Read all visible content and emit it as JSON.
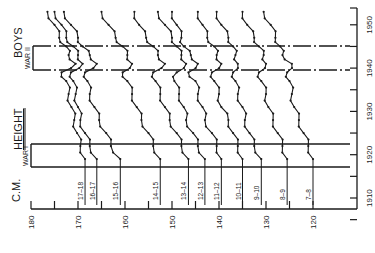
{
  "chart_data": {
    "type": "line",
    "title": "HEIGHT",
    "subtitle": "BOYS",
    "orientation": "rotated-90-ccw",
    "xlabel": "Year",
    "ylabel": "C.M.",
    "xlim": [
      1905,
      1955
    ],
    "ylim": [
      115,
      180
    ],
    "x_ticks": [
      1910,
      1920,
      1930,
      1940,
      1950
    ],
    "x_minor_ticks": [
      1905,
      1915,
      1925,
      1935,
      1945
    ],
    "y_ticks": [
      120,
      130,
      140,
      150,
      160,
      170,
      180
    ],
    "y_minor_ticks": [
      125,
      135,
      145,
      155,
      165,
      175
    ],
    "grid": false,
    "annotations": [
      {
        "label": "WAR I",
        "x_range": [
          1914,
          1919
        ]
      },
      {
        "label": "WAR II",
        "x_range": [
          1939,
          1945
        ]
      }
    ],
    "x": [
      1919,
      1922,
      1925,
      1928,
      1931,
      1934,
      1937,
      1939,
      1941,
      1943,
      1945,
      1947,
      1950,
      1953
    ],
    "series": [
      {
        "name": "17-18",
        "values": [
          168.5,
          169.5,
          170.2,
          170.8,
          171.4,
          172.0,
          172.5,
          173.5,
          170.5,
          172.0,
          172.5,
          174.0,
          175.0,
          176.5
        ]
      },
      {
        "name": "16-17",
        "values": [
          166.0,
          167.5,
          168.5,
          169.5,
          170.0,
          170.5,
          171.0,
          171.5,
          169.0,
          170.0,
          171.0,
          172.5,
          173.5,
          175.0
        ]
      },
      {
        "name": "15-16",
        "values": [
          161.0,
          163.0,
          164.0,
          165.5,
          166.5,
          167.5,
          168.0,
          168.5,
          166.0,
          167.5,
          169.0,
          170.0,
          171.5,
          173.0
        ]
      },
      {
        "name": "14-15",
        "values": [
          152.5,
          154.0,
          155.0,
          156.5,
          157.5,
          158.5,
          159.5,
          160.5,
          158.5,
          159.5,
          160.5,
          162.0,
          163.5,
          165.0
        ]
      },
      {
        "name": "13-14",
        "values": [
          146.5,
          148.0,
          149.0,
          150.5,
          151.5,
          152.5,
          153.5,
          154.0,
          151.5,
          153.0,
          154.0,
          155.5,
          157.0,
          158.0
        ]
      },
      {
        "name": "12-13",
        "values": [
          143.0,
          144.5,
          145.5,
          147.0,
          147.5,
          148.5,
          149.5,
          149.0,
          147.0,
          148.0,
          149.0,
          150.0,
          151.5,
          153.0
        ]
      },
      {
        "name": "11-12",
        "values": [
          139.5,
          140.5,
          141.5,
          143.0,
          143.5,
          144.5,
          145.0,
          146.5,
          144.5,
          146.0,
          147.5,
          148.0,
          149.0,
          150.0
        ]
      },
      {
        "name": "10-11",
        "values": [
          135.0,
          136.0,
          137.0,
          138.0,
          139.5,
          140.0,
          141.0,
          141.5,
          139.5,
          140.5,
          141.0,
          142.5,
          143.5,
          144.5
        ]
      },
      {
        "name": "9-10",
        "values": [
          131.0,
          132.5,
          133.5,
          134.5,
          135.0,
          136.0,
          136.5,
          137.0,
          136.0,
          136.5,
          137.0,
          138.0,
          139.5,
          140.5
        ]
      },
      {
        "name": "8-9",
        "values": [
          125.5,
          126.5,
          127.5,
          128.5,
          129.5,
          130.0,
          131.0,
          131.5,
          130.0,
          130.5,
          131.5,
          132.5,
          134.0,
          135.0
        ]
      },
      {
        "name": "7-8",
        "values": [
          120.0,
          121.0,
          122.0,
          123.0,
          124.0,
          124.5,
          125.0,
          125.5,
          124.5,
          126.5,
          127.0,
          128.0,
          129.0,
          130.5
        ]
      }
    ],
    "series_start": [
      {
        "name": "17-18",
        "start_year": 1919
      },
      {
        "name": "16-17",
        "start_year": 1919
      },
      {
        "name": "15-16",
        "start_year": 1919
      },
      {
        "name": "14-15",
        "start_year": 1914
      },
      {
        "name": "13-14",
        "start_year": 1915
      },
      {
        "name": "12-13",
        "start_year": 1915
      },
      {
        "name": "11-12",
        "start_year": 1913
      },
      {
        "name": "10-11",
        "start_year": 1913
      },
      {
        "name": "9-10",
        "start_year": 1911
      },
      {
        "name": "8-9",
        "start_year": 1910
      },
      {
        "name": "7-8",
        "start_year": 1907
      }
    ]
  },
  "labels": {
    "title": "HEIGHT",
    "subtitle": "BOYS",
    "unit": "C.M.",
    "war1": "WAR I",
    "war2": "WAR II"
  }
}
